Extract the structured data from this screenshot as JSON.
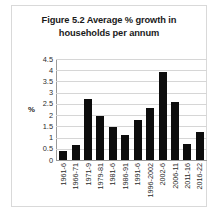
{
  "figure": {
    "title_line1": "Figure 5.2 Average % growth in",
    "title_line2": "households per annum"
  },
  "chart_data": {
    "type": "bar",
    "title": "Figure 5.2 Average % growth in households per annum",
    "xlabel": "",
    "ylabel": "%",
    "ylim": [
      0,
      4.5
    ],
    "yticks": [
      "0",
      "0.5",
      "1",
      "1.5",
      "2",
      "2.5",
      "3",
      "3.5",
      "4",
      "4.5"
    ],
    "grid": true,
    "legend": null,
    "bar_color": "#0d0d0d",
    "gridline_color": "#d6d6d6",
    "categories": [
      "1961-6",
      "1966-71",
      "1971-9",
      "1979-81",
      "1981-6",
      "1986-91",
      "1991-6",
      "1996-2002",
      "2002-6",
      "2006-11",
      "2011-16",
      "2016-22"
    ],
    "values": [
      0.38,
      0.68,
      2.72,
      1.97,
      1.47,
      1.1,
      1.8,
      2.32,
      3.92,
      2.57,
      0.72,
      1.27
    ]
  }
}
